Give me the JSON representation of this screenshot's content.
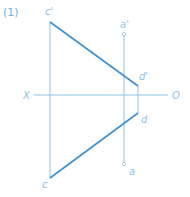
{
  "figure": {
    "number_label": "(1)",
    "colors": {
      "thin_line": "#8ec3ea",
      "thick_line": "#3d8fd1",
      "label": "#8ec3ea"
    },
    "axis": {
      "left_label": "X",
      "right_label": "O"
    },
    "points": {
      "c_prime": {
        "label": "c'"
      },
      "c": {
        "label": "c"
      },
      "d_prime": {
        "label": "d'"
      },
      "d": {
        "label": "d"
      },
      "a_prime": {
        "label": "a'"
      },
      "a": {
        "label": "a"
      }
    }
  }
}
